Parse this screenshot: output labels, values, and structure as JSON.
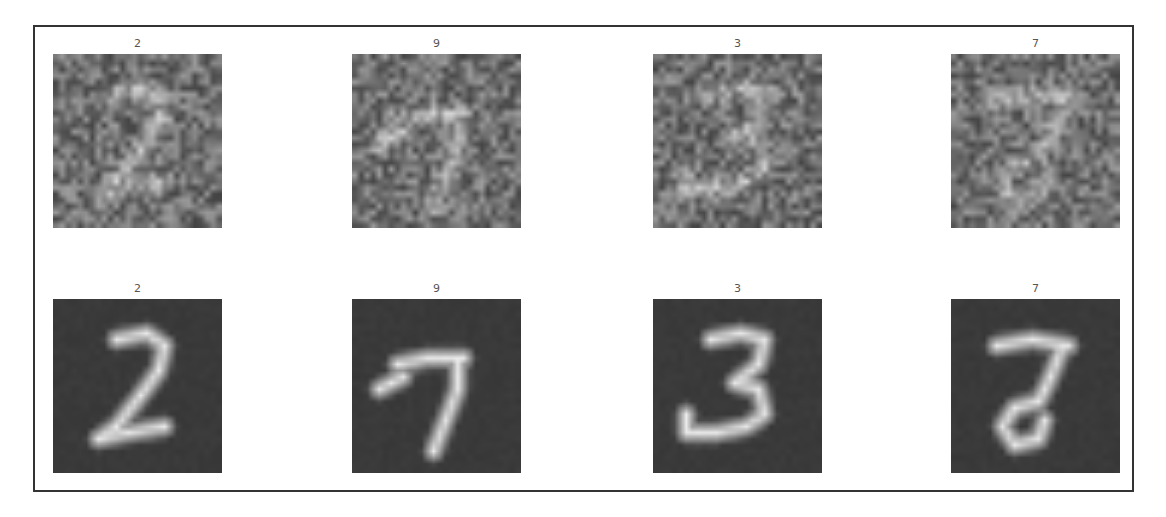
{
  "figure": {
    "rows": [
      {
        "name": "noisy-input",
        "cells": [
          {
            "label": "2",
            "digit": "2",
            "style": "noisy"
          },
          {
            "label": "9",
            "digit": "9",
            "style": "noisy"
          },
          {
            "label": "3",
            "digit": "3",
            "style": "noisy"
          },
          {
            "label": "7",
            "digit": "7",
            "style": "noisy"
          }
        ]
      },
      {
        "name": "reconstructed-output",
        "cells": [
          {
            "label": "2",
            "digit": "2",
            "style": "clean"
          },
          {
            "label": "9",
            "digit": "9",
            "style": "clean"
          },
          {
            "label": "3",
            "digit": "3",
            "style": "clean"
          },
          {
            "label": "7",
            "digit": "7",
            "style": "clean"
          }
        ]
      }
    ],
    "colors": {
      "border": "#333333",
      "label": "#555555",
      "noisy_background": "#6e6e6e",
      "clean_background": "#3a3a3a",
      "stroke_bright": "#e6e6e6"
    }
  }
}
